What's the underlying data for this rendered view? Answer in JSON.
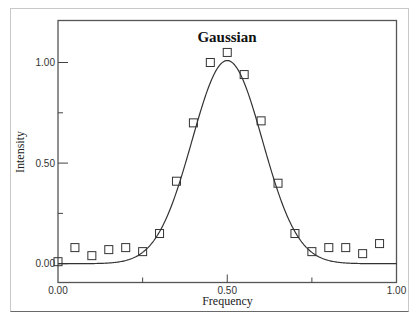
{
  "chart_data": {
    "type": "scatter",
    "title": "Gaussian",
    "xlabel": "Frequency",
    "ylabel": "Intensity",
    "xlim": [
      0.0,
      1.0
    ],
    "ylim": [
      -0.1,
      1.2
    ],
    "x_ticks": [
      {
        "value": 0.0,
        "label": "0.00"
      },
      {
        "value": 0.25,
        "label": ""
      },
      {
        "value": 0.5,
        "label": "0.50"
      },
      {
        "value": 0.75,
        "label": ""
      },
      {
        "value": 1.0,
        "label": "1.00"
      }
    ],
    "y_ticks": [
      {
        "value": 0.0,
        "label": "0.00"
      },
      {
        "value": 0.25,
        "label": ""
      },
      {
        "value": 0.5,
        "label": "0.50"
      },
      {
        "value": 0.75,
        "label": ""
      },
      {
        "value": 1.0,
        "label": "1.00"
      }
    ],
    "grid": false,
    "series": [
      {
        "name": "Data",
        "kind": "scatter",
        "marker": "open-square",
        "x": [
          0.0,
          0.05,
          0.1,
          0.15,
          0.2,
          0.25,
          0.3,
          0.35,
          0.4,
          0.45,
          0.5,
          0.55,
          0.6,
          0.65,
          0.7,
          0.75,
          0.8,
          0.85,
          0.9,
          0.95
        ],
        "y": [
          0.01,
          0.08,
          0.04,
          0.07,
          0.08,
          0.06,
          0.15,
          0.41,
          0.7,
          1.0,
          1.05,
          0.94,
          0.71,
          0.4,
          0.15,
          0.06,
          0.08,
          0.08,
          0.05,
          0.1
        ]
      },
      {
        "name": "Gaussian fit",
        "kind": "line",
        "function": "gaussian",
        "amplitude": 1.01,
        "center": 0.5,
        "sigma": 0.104,
        "baseline": 0.0
      }
    ]
  }
}
